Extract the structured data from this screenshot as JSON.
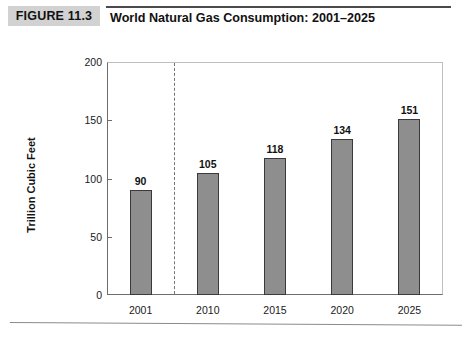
{
  "header": {
    "figure_badge": "FIGURE 11.3",
    "title": "World Natural Gas Consumption: 2001–2025"
  },
  "chart_data": {
    "type": "bar",
    "title": "World Natural Gas Consumption: 2001–2025",
    "xlabel": "",
    "ylabel": "Trillion Cubic Feet",
    "categories": [
      "2001",
      "2010",
      "2015",
      "2020",
      "2025"
    ],
    "values": [
      90,
      105,
      118,
      134,
      151
    ],
    "value_labels": [
      "90",
      "105",
      "118",
      "134",
      "151"
    ],
    "ylim": [
      0,
      200
    ],
    "yticks": [
      0,
      50,
      100,
      150,
      200
    ],
    "ytick_labels": [
      "0",
      "50",
      "100",
      "150",
      "200"
    ],
    "grid": false,
    "legend": null,
    "annotations": [
      {
        "name": "projection-divider",
        "type": "vertical-dashed-line",
        "between": [
          "2001",
          "2010"
        ]
      }
    ],
    "colors": {
      "bar_fill": "#8e8e8e",
      "bar_border": "#3a3a3a",
      "axis": "#6d6d6d",
      "badge_background": "#d2d2d2",
      "text": "#111111"
    }
  }
}
